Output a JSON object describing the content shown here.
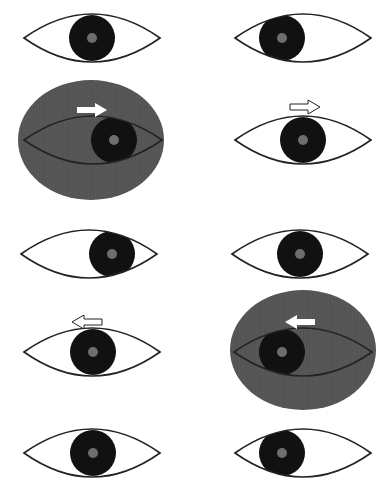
{
  "colors": {
    "background": "#ffffff",
    "outline": "#222222",
    "iris": "#111111",
    "pupil": "#6e6e6e",
    "field": "#555555",
    "arrow_fill": "#ffffff"
  },
  "eyes": [
    {
      "id": "r1-left",
      "cx": 92,
      "cy": 38,
      "rx": 68,
      "ry": 24,
      "iris_x": 92,
      "field": false
    },
    {
      "id": "r1-right",
      "cx": 303,
      "cy": 38,
      "rx": 68,
      "ry": 24,
      "iris_x": 282,
      "field": false
    },
    {
      "id": "r2-left",
      "cx": 93,
      "cy": 140,
      "rx": 69,
      "ry": 24,
      "iris_x": 114,
      "field": true,
      "field_cx": 91,
      "field_cy": 140,
      "field_rx": 73,
      "field_ry": 60
    },
    {
      "id": "r2-right",
      "cx": 303,
      "cy": 140,
      "rx": 68,
      "ry": 24,
      "iris_x": 303,
      "field": false
    },
    {
      "id": "r3-left",
      "cx": 89,
      "cy": 254,
      "rx": 68,
      "ry": 24,
      "iris_x": 112,
      "field": false
    },
    {
      "id": "r3-right",
      "cx": 300,
      "cy": 254,
      "rx": 68,
      "ry": 24,
      "iris_x": 300,
      "field": false
    },
    {
      "id": "r4-left",
      "cx": 92,
      "cy": 352,
      "rx": 68,
      "ry": 24,
      "iris_x": 93,
      "field": false
    },
    {
      "id": "r4-right",
      "cx": 303,
      "cy": 352,
      "rx": 69,
      "ry": 24,
      "iris_x": 282,
      "field": true,
      "field_cx": 303,
      "field_cy": 350,
      "field_rx": 73,
      "field_ry": 60
    },
    {
      "id": "r5-left",
      "cx": 92,
      "cy": 453,
      "rx": 68,
      "ry": 24,
      "iris_x": 93,
      "field": false
    },
    {
      "id": "r5-right",
      "cx": 303,
      "cy": 453,
      "rx": 68,
      "ry": 24,
      "iris_x": 282,
      "field": false
    }
  ],
  "iris": {
    "r": 23,
    "pupil_r": 5
  },
  "arrows": [
    {
      "id": "arrow-r2-left",
      "direction": "right",
      "style": "solid",
      "x": 77,
      "y": 103
    },
    {
      "id": "arrow-r2-right",
      "direction": "right",
      "style": "outline",
      "x": 290,
      "y": 100
    },
    {
      "id": "arrow-r4-left",
      "direction": "left",
      "style": "outline",
      "x": 72,
      "y": 315
    },
    {
      "id": "arrow-r4-right",
      "direction": "left",
      "style": "solid",
      "x": 285,
      "y": 315
    }
  ]
}
